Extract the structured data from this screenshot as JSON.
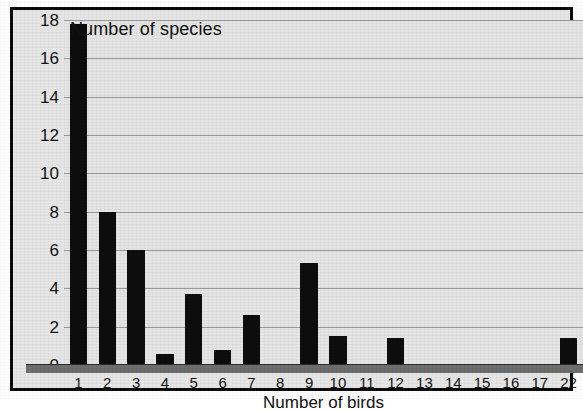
{
  "chart_data": {
    "type": "bar",
    "title": "Number of species",
    "xlabel": "Number of birds",
    "ylabel": "Number of species",
    "categories": [
      "1",
      "2",
      "3",
      "4",
      "5",
      "6",
      "7",
      "8",
      "9",
      "10",
      "11",
      "12",
      "13",
      "14",
      "15",
      "16",
      "17",
      "22"
    ],
    "values": [
      17.8,
      8.0,
      6.0,
      0.6,
      3.7,
      0.8,
      2.6,
      0,
      5.3,
      1.5,
      0,
      1.4,
      0,
      0,
      0,
      0,
      0,
      1.4
    ],
    "ylim": [
      0,
      18
    ],
    "yticks": [
      0,
      2,
      4,
      6,
      8,
      10,
      12,
      14,
      16,
      18
    ],
    "ytick_labels": [
      "0",
      "2",
      "4",
      "6",
      "8",
      "10",
      "12",
      "14",
      "16",
      "18"
    ],
    "grid": true,
    "legend": "none",
    "bar_color": "#0d0d0d",
    "plot_background": "#e4e4e4",
    "gridline_color": "#9a9a9a",
    "frame_color": "#0b0b0b"
  },
  "figure": {
    "top_title": "Number of species",
    "bottom_title": "Number of birds"
  }
}
